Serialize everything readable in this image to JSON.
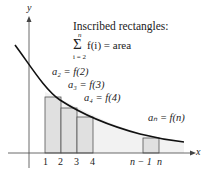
{
  "axes": {
    "x_label": "x",
    "y_label": "y"
  },
  "title": "Inscribed rectangles:",
  "sum": {
    "sigma": "Σ",
    "upper": "n",
    "lower": "i = 2",
    "expr": "f(i) = area"
  },
  "annotations": {
    "a2": "a₂ = f(2)",
    "a3": "a₃ = f(3)",
    "a4": "a₄ = f(4)",
    "an": "aₙ = f(n)"
  },
  "ticks": [
    "1",
    "2",
    "3",
    "4",
    "n − 1",
    "n"
  ],
  "colors": {
    "rect_fill": "#e0e0e0",
    "rect_stroke": "#555555",
    "curve": "#111111",
    "region": "#f0f0f0"
  }
}
